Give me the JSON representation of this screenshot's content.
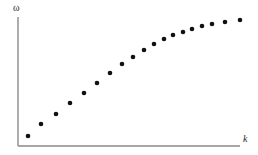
{
  "chart_data": {
    "type": "scatter",
    "title": "",
    "subtitle": "",
    "xlabel": "k",
    "ylabel": "ω",
    "xlim": [
      0,
      258
    ],
    "ylim": [
      0,
      146
    ],
    "grid": false,
    "legend": null,
    "annotations": [],
    "marker": {
      "shape": "circle",
      "color": "#111111",
      "size_px": 4.6
    },
    "axis": {
      "color": "#8a8a8a",
      "width_px": 1.4,
      "origin": [
        18,
        146
      ],
      "y_axis_top": 17,
      "x_axis_right": 240,
      "arrow": false
    },
    "n_points": 19,
    "x": [
      28,
      41,
      56,
      70,
      84,
      97,
      110,
      122,
      133,
      144,
      154,
      164,
      173,
      183,
      192,
      202,
      212,
      225,
      240
    ],
    "y": [
      136,
      124,
      114,
      103,
      93,
      83,
      73,
      64,
      57,
      50,
      44,
      39,
      35,
      32,
      29,
      26,
      24,
      22,
      20
    ]
  },
  "figure": {
    "background_color": "#ffffff",
    "width": 258,
    "height": 155
  }
}
